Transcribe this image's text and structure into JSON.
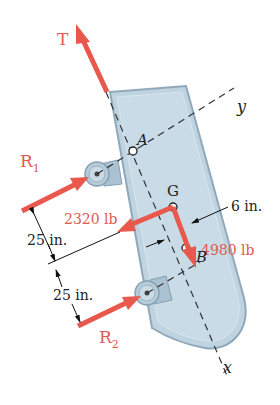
{
  "figure": {
    "type": "free-body diagram",
    "colors": {
      "force": "#e8584c",
      "force_label": "#d9534a",
      "body_fill": "#bfd3e0",
      "body_edge": "#8fa9bb",
      "axis": "#444444",
      "dimension": "#111111"
    },
    "forces": [
      {
        "id": "T",
        "label": "T"
      },
      {
        "id": "R1",
        "label": "R",
        "subscript": "1"
      },
      {
        "id": "R2",
        "label": "R",
        "subscript": "2"
      },
      {
        "id": "W_perp",
        "label": "2320 lb"
      },
      {
        "id": "W_para",
        "label": "4980 lb"
      }
    ],
    "points": [
      {
        "id": "A",
        "label": "A"
      },
      {
        "id": "G",
        "label": "G"
      },
      {
        "id": "B",
        "label": "B"
      }
    ],
    "axes": [
      {
        "id": "x",
        "label": "x"
      },
      {
        "id": "y",
        "label": "y"
      }
    ],
    "dimensions": [
      {
        "id": "offset",
        "label": "6 in."
      },
      {
        "id": "d1",
        "label": "25 in."
      },
      {
        "id": "d2",
        "label": "25 in."
      }
    ]
  }
}
